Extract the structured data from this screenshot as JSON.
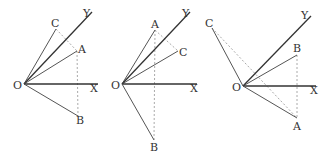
{
  "diagram": {
    "panels": [
      {
        "id": "panel-1",
        "labels": {
          "origin": "O",
          "x_axis": "X",
          "y_axis": "Y",
          "a": "A",
          "b": "B",
          "c": "C"
        },
        "solid_rays": [
          "OC",
          "OY",
          "OA",
          "OX",
          "OB"
        ],
        "dashed_segments": [
          "C-A",
          "A-B"
        ]
      },
      {
        "id": "panel-2",
        "labels": {
          "origin": "O",
          "x_axis": "X",
          "y_axis": "Y",
          "a": "A",
          "b": "B",
          "c": "C"
        },
        "solid_rays": [
          "OA",
          "OY",
          "OC",
          "OX",
          "OB"
        ],
        "dashed_segments": [
          "A-C",
          "A-B"
        ]
      },
      {
        "id": "panel-3",
        "labels": {
          "origin": "O",
          "x_axis": "X",
          "y_axis": "Y",
          "a": "A",
          "b": "B",
          "c": "C"
        },
        "solid_rays": [
          "OC",
          "OY",
          "OB",
          "OX",
          "OA"
        ],
        "dashed_segments": [
          "C-A",
          "B-A"
        ]
      }
    ]
  }
}
